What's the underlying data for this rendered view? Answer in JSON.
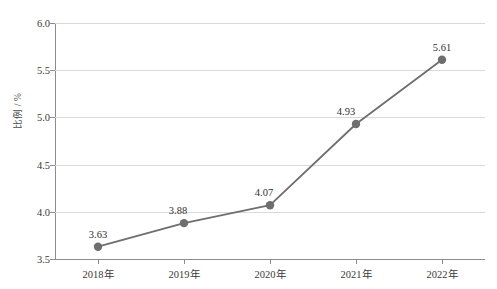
{
  "chart_data": {
    "type": "line",
    "title": "",
    "subtitle": "",
    "xlabel": "",
    "ylabel": "比例 / %",
    "categories": [
      "2018年",
      "2019年",
      "2020年",
      "2021年",
      "2022年"
    ],
    "values": [
      3.63,
      3.88,
      4.07,
      4.93,
      5.61
    ],
    "point_labels": [
      "3.63",
      "3.88",
      "4.07",
      "4.93",
      "5.61"
    ],
    "ylim": [
      3.5,
      6.0
    ],
    "y_ticks": [
      "3.5",
      "4.0",
      "4.5",
      "5.0",
      "5.5",
      "6.0"
    ],
    "y_tick_values": [
      3.5,
      4.0,
      4.5,
      5.0,
      5.5,
      6.0
    ],
    "grid": true,
    "legend": false,
    "legend_position": "none",
    "series": [
      {
        "name": "比例",
        "values": [
          3.63,
          3.88,
          4.07,
          4.93,
          5.61
        ]
      }
    ],
    "colors": {
      "line": "#6e6e6e",
      "marker": "#6e6e6e",
      "grid": "#d9d9d9",
      "axis": "#8c8c8c",
      "text": "#3a3a3a",
      "background": "#ffffff"
    }
  }
}
